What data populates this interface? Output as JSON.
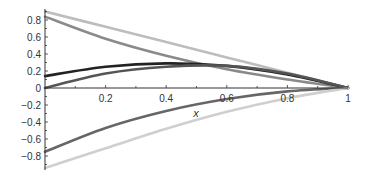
{
  "chart_data": {
    "type": "line",
    "title": "",
    "xlabel": "x",
    "ylabel": "",
    "xlim": [
      0,
      1
    ],
    "ylim": [
      -0.95,
      0.92
    ],
    "grid": false,
    "legend": null,
    "x_ticks": [
      "0.2",
      "0.4",
      "0.6",
      "0.8",
      "1"
    ],
    "y_ticks": [
      "0.8",
      "0.6",
      "0.4",
      "0.2",
      "0",
      "-0.2",
      "-0.4",
      "-0.6",
      "-0.8"
    ],
    "x": [
      0,
      0.2,
      0.4,
      0.6,
      0.8,
      1
    ],
    "series": [
      {
        "name": "curve-1",
        "color": "#bdbdbd",
        "values": [
          0.9,
          0.72,
          0.54,
          0.36,
          0.18,
          0.0
        ]
      },
      {
        "name": "curve-2",
        "color": "#8a8a8a",
        "values": [
          0.84,
          0.58,
          0.38,
          0.22,
          0.1,
          0.0
        ]
      },
      {
        "name": "curve-3",
        "color": "#222222",
        "values": [
          0.14,
          0.25,
          0.29,
          0.26,
          0.16,
          0.0
        ]
      },
      {
        "name": "curve-4",
        "color": "#555555",
        "values": [
          0.0,
          0.17,
          0.25,
          0.26,
          0.17,
          0.0
        ]
      },
      {
        "name": "curve-5",
        "color": "#666666",
        "values": [
          -0.75,
          -0.47,
          -0.27,
          -0.13,
          -0.04,
          0.0
        ]
      },
      {
        "name": "curve-6",
        "color": "#cfcfcf",
        "values": [
          -0.94,
          -0.71,
          -0.48,
          -0.28,
          -0.12,
          0.0
        ]
      }
    ]
  }
}
